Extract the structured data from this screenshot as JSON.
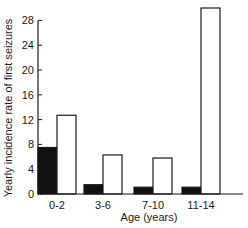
{
  "chart_data": {
    "type": "bar",
    "title": "",
    "xlabel": "Age (years)",
    "ylabel": "Yearly incidence rate of first seizures",
    "categories": [
      "0-2",
      "3-6",
      "7-10",
      "11-14"
    ],
    "series": [
      {
        "name": "black",
        "color": "#111111",
        "values": [
          7.5,
          1.5,
          1.1,
          1.1
        ]
      },
      {
        "name": "white",
        "color": "#ffffff",
        "values": [
          12.7,
          6.3,
          5.8,
          30
        ]
      }
    ],
    "ylim": [
      0,
      28
    ],
    "yticks": [
      0,
      4,
      8,
      12,
      16,
      20,
      24,
      28
    ],
    "grid": false,
    "legend": "none"
  }
}
